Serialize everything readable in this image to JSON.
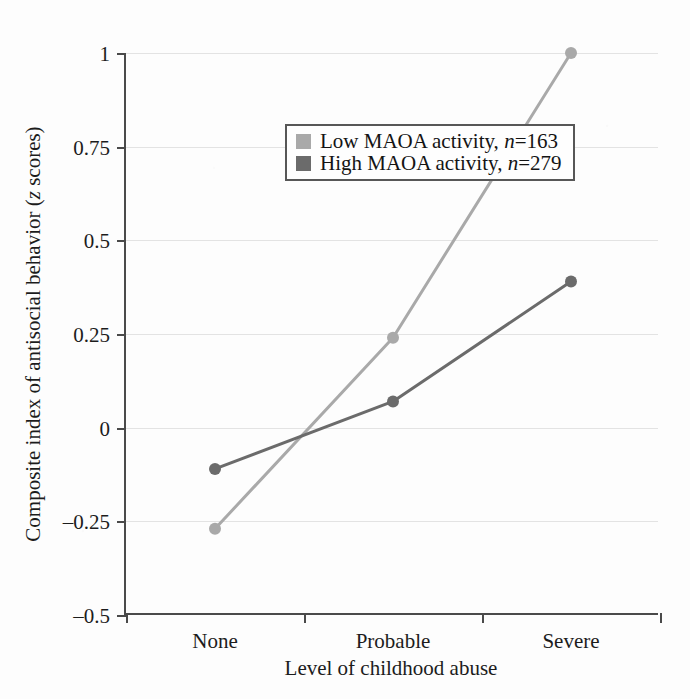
{
  "chart_data": {
    "type": "line",
    "title": "",
    "subtitle": "",
    "xlabel": "Level of childhood abuse",
    "ylabel": "Composite index of antisocial behavior (z scores)",
    "ylabel_parts": {
      "before": "Composite index of antisocial behavior (",
      "italic": "z",
      "after": " scores)"
    },
    "categories": [
      "None",
      "Probable",
      "Severe"
    ],
    "x": [
      0,
      1,
      2
    ],
    "ylim": [
      -0.5,
      1
    ],
    "yticks": [
      1,
      0.75,
      0.5,
      0.25,
      0,
      -0.25,
      -0.5
    ],
    "ytick_labels": [
      "1",
      "0.75",
      "0.5",
      "0.25",
      "0",
      "–0.25",
      "–0.5"
    ],
    "grid": "horizontal",
    "legend_position": "top-left inside",
    "series": [
      {
        "name": "Low MAOA activity, n=163",
        "label_prefix": "Low MAOA activity, ",
        "label_italic": "n",
        "label_suffix": "=163",
        "n": 163,
        "color": "#a9a9a9",
        "marker": "circle",
        "values": [
          -0.27,
          0.24,
          1.0
        ]
      },
      {
        "name": "High MAOA activity, n=279",
        "label_prefix": "High MAOA activity, ",
        "label_italic": "n",
        "label_suffix": "=279",
        "n": 279,
        "color": "#6b6b6b",
        "marker": "circle",
        "values": [
          -0.11,
          0.07,
          0.39
        ]
      }
    ]
  },
  "axes": {
    "x_title": "Level of childhood abuse",
    "category_labels": [
      "None",
      "Probable",
      "Severe"
    ],
    "y_tick_labels": [
      "1",
      "0.75",
      "0.5",
      "0.25",
      "0",
      "–0.25",
      "–0.5"
    ]
  },
  "legend": {
    "rows": [
      {
        "prefix": "Low MAOA activity, ",
        "italic": "n",
        "suffix": "=163",
        "color": "#a9a9a9"
      },
      {
        "prefix": "High MAOA activity, ",
        "italic": "n",
        "suffix": "=279",
        "color": "#6b6b6b"
      }
    ]
  },
  "colors": {
    "low_maoa": "#a9a9a9",
    "high_maoa": "#6b6b6b",
    "axis": "#4a4a4a",
    "grid": "#e3e3e3",
    "background": "#fdfdfd",
    "text": "#1c1c1c"
  }
}
